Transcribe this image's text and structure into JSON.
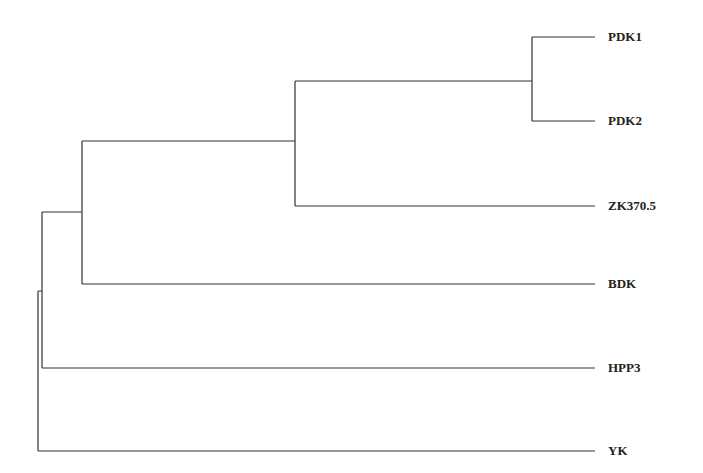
{
  "diagram": {
    "type": "phylogenetic-tree",
    "line_color": "#333333",
    "leaves": [
      {
        "label": "PDK1",
        "y": 37
      },
      {
        "label": "PDK2",
        "y": 121
      },
      {
        "label": "ZK370.5",
        "y": 206
      },
      {
        "label": "BDK",
        "y": 284
      },
      {
        "label": "HPP3",
        "y": 368
      },
      {
        "label": "YK",
        "y": 451
      }
    ],
    "leaf_x_end": 595,
    "label_x": 608,
    "nodes": [
      {
        "id": "pdk",
        "x": 532,
        "y_top": 37,
        "y_bottom": 121,
        "y_mid": 80
      },
      {
        "id": "pdk-zk",
        "x": 295,
        "y_top": 81,
        "y_bottom": 206,
        "y_mid": 141
      },
      {
        "id": "bdk-clade",
        "x": 82,
        "y_top": 141,
        "y_bottom": 284,
        "y_mid": 212
      },
      {
        "id": "hpp3-clade",
        "x": 42,
        "y_top": 212,
        "y_bottom": 368,
        "y_mid": 291
      },
      {
        "id": "root",
        "x": 38,
        "y_top": 291,
        "y_bottom": 451
      }
    ]
  }
}
